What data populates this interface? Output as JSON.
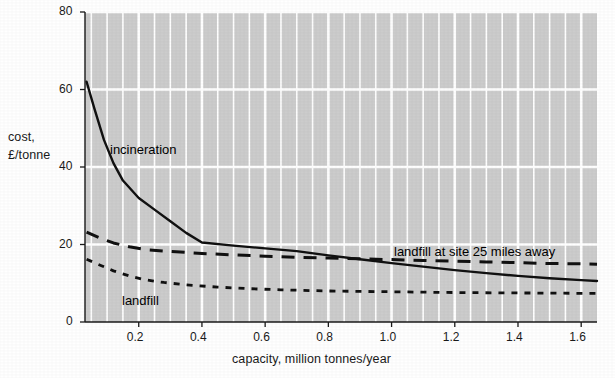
{
  "chart_data": {
    "type": "line",
    "title": "",
    "xlabel": "capacity, million tonnes/year",
    "ylabel": "cost,\n£/tonne",
    "ylabel_line1": "cost,",
    "ylabel_line2": "£/tonne",
    "xlim": [
      0.03,
      1.65
    ],
    "ylim": [
      0,
      80
    ],
    "xticks": [
      0.2,
      0.4,
      0.6,
      0.8,
      1.0,
      1.2,
      1.4,
      1.6
    ],
    "xtick_labels": [
      "0.2",
      "0.4",
      "0.6",
      "0.8",
      "1.0",
      "1.2",
      "1.4",
      "1.6"
    ],
    "yticks": [
      0,
      20,
      40,
      60,
      80
    ],
    "ytick_labels": [
      "0",
      "20",
      "40",
      "60",
      "80"
    ],
    "grid": true,
    "grid_color": "#ffffff",
    "plot_background": "#cccccc",
    "legend_position": "inline-annotations",
    "series": [
      {
        "name": "incineration",
        "style": "solid",
        "color": "#111111",
        "label_text": "incineration",
        "points": [
          [
            0.035,
            62.0
          ],
          [
            0.06,
            55.0
          ],
          [
            0.09,
            47.0
          ],
          [
            0.12,
            41.0
          ],
          [
            0.15,
            36.5
          ],
          [
            0.2,
            32.0
          ],
          [
            0.25,
            29.0
          ],
          [
            0.3,
            26.0
          ],
          [
            0.35,
            23.0
          ],
          [
            0.4,
            20.5
          ],
          [
            0.5,
            19.7
          ],
          [
            0.6,
            19.0
          ],
          [
            0.7,
            18.3
          ],
          [
            0.8,
            17.2
          ],
          [
            0.9,
            16.2
          ],
          [
            1.0,
            15.2
          ],
          [
            1.1,
            14.3
          ],
          [
            1.2,
            13.4
          ],
          [
            1.3,
            12.6
          ],
          [
            1.4,
            11.9
          ],
          [
            1.5,
            11.3
          ],
          [
            1.6,
            10.8
          ],
          [
            1.65,
            10.6
          ]
        ]
      },
      {
        "name": "landfill at site 25 miles away",
        "style": "dashed",
        "color": "#111111",
        "label_text": "landfill at site 25 miles away",
        "points": [
          [
            0.035,
            23.2
          ],
          [
            0.08,
            21.6
          ],
          [
            0.12,
            20.4
          ],
          [
            0.17,
            19.4
          ],
          [
            0.22,
            18.7
          ],
          [
            0.3,
            18.2
          ],
          [
            0.4,
            17.7
          ],
          [
            0.5,
            17.3
          ],
          [
            0.6,
            17.0
          ],
          [
            0.7,
            16.7
          ],
          [
            0.8,
            16.5
          ],
          [
            0.9,
            16.3
          ],
          [
            1.0,
            16.1
          ],
          [
            1.1,
            15.9
          ],
          [
            1.2,
            15.7
          ],
          [
            1.3,
            15.5
          ],
          [
            1.4,
            15.3
          ],
          [
            1.5,
            15.1
          ],
          [
            1.6,
            15.0
          ],
          [
            1.65,
            14.9
          ]
        ]
      },
      {
        "name": "landfill",
        "style": "dotted",
        "color": "#111111",
        "label_text": "landfill",
        "points": [
          [
            0.035,
            16.2
          ],
          [
            0.08,
            14.6
          ],
          [
            0.12,
            13.2
          ],
          [
            0.17,
            11.9
          ],
          [
            0.22,
            10.9
          ],
          [
            0.28,
            10.2
          ],
          [
            0.35,
            9.6
          ],
          [
            0.45,
            9.0
          ],
          [
            0.55,
            8.6
          ],
          [
            0.65,
            8.3
          ],
          [
            0.8,
            8.0
          ],
          [
            1.0,
            7.8
          ],
          [
            1.2,
            7.6
          ],
          [
            1.4,
            7.5
          ],
          [
            1.6,
            7.4
          ],
          [
            1.65,
            7.4
          ]
        ]
      }
    ],
    "annotations": [
      {
        "name": "incineration-label",
        "text": "incineration",
        "x_px": 110,
        "y_px": 142
      },
      {
        "name": "landfill-label",
        "text": "landfill",
        "x_px": 122,
        "y_px": 293
      },
      {
        "name": "landfill-25-miles-label",
        "text": "landfill at site 25 miles away",
        "x_px": 394,
        "y_px": 244
      }
    ],
    "plot_area_px": {
      "left": 85,
      "top": 12,
      "right": 597,
      "bottom": 322
    },
    "minor_gridline_step": 0.05
  }
}
